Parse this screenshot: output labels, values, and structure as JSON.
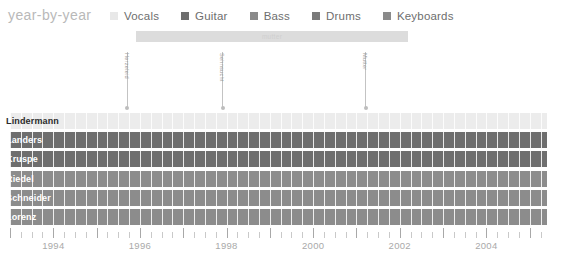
{
  "header": {
    "title": "year-by-year",
    "legend": [
      {
        "label": "Vocals",
        "color": "#e8e8e8"
      },
      {
        "label": "Guitar",
        "color": "#6e6e6e"
      },
      {
        "label": "Bass",
        "color": "#8a8a8a"
      },
      {
        "label": "Drums",
        "color": "#7a7a7a"
      },
      {
        "label": "Keyboards",
        "color": "#8a8a8a"
      }
    ]
  },
  "albums": {
    "span": {
      "label": "mutter",
      "start": 1995.9,
      "end": 2002.2,
      "color": "#dcdcdc",
      "text_color": "#cfcfcf"
    },
    "markers": [
      {
        "label": "Herzeleid",
        "year": 1995.7
      },
      {
        "label": "Sehnsucht",
        "year": 1997.9
      },
      {
        "label": "Mutter",
        "year": 2001.2
      }
    ]
  },
  "chart_data": {
    "type": "bar",
    "title": "year-by-year",
    "xlabel": "",
    "ylabel": "",
    "xlim": [
      1993.0,
      2005.4
    ],
    "grid": true,
    "legend_position": "top",
    "categories": [
      "Lindermann",
      "Landers",
      "Kruspe",
      "Riedel",
      "Schneider",
      "Lorenz"
    ],
    "series": [
      {
        "name": "Lindermann",
        "instrument": "Vocals",
        "color": "#ececec",
        "label_on_dark": false,
        "start": 1993.0,
        "end": 2005.4
      },
      {
        "name": "Landers",
        "instrument": "Guitar",
        "color": "#6e6e6e",
        "label_on_dark": true,
        "start": 1993.0,
        "end": 2005.4
      },
      {
        "name": "Kruspe",
        "instrument": "Guitar",
        "color": "#6e6e6e",
        "label_on_dark": true,
        "start": 1993.0,
        "end": 2005.4
      },
      {
        "name": "Riedel",
        "instrument": "Bass",
        "color": "#8c8c8c",
        "label_on_dark": true,
        "start": 1993.0,
        "end": 2005.4
      },
      {
        "name": "Schneider",
        "instrument": "Drums",
        "color": "#8c8c8c",
        "label_on_dark": true,
        "start": 1993.0,
        "end": 2005.4
      },
      {
        "name": "Lorenz",
        "instrument": "Keyboards",
        "color": "#8c8c8c",
        "label_on_dark": true,
        "start": 1993.0,
        "end": 2005.4
      }
    ],
    "axis": {
      "tick_labels": [
        "1994",
        "1996",
        "1998",
        "2000",
        "2002",
        "2004"
      ],
      "tick_values": [
        1994,
        1996,
        1998,
        2000,
        2002,
        2004
      ],
      "minor_tick_step": 0.25
    }
  }
}
